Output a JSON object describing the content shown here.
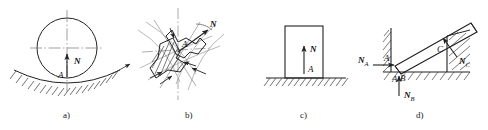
{
  "figure": {
    "stroke_color": "#222222",
    "thin_color": "#555555",
    "background": "#ffffff",
    "panels": [
      {
        "id": "a",
        "caption": "a)",
        "description": "Cylinder resting in a concave hatched surface; normal force N acts vertically upward through contact point A along the line of centers.",
        "labels": [
          {
            "name": "force-label-n",
            "text": "N"
          },
          {
            "name": "point-label-a",
            "text": "A"
          }
        ],
        "force": {
          "symbol": "N",
          "direction": "vertical-up",
          "angle_deg": 90
        },
        "contact_point": "A"
      },
      {
        "id": "b",
        "caption": "b)",
        "description": "Two irregular hatched bodies in point contact at A; normal force N is directed along the common normal, inclined up and to the right.",
        "labels": [
          {
            "name": "force-label-n",
            "text": "N"
          },
          {
            "name": "point-label-a",
            "text": "A"
          }
        ],
        "force": {
          "symbol": "N",
          "direction": "up-right",
          "angle_deg": 35
        },
        "contact_point": "A"
      },
      {
        "id": "c",
        "caption": "c)",
        "description": "Rectangular block resting on a flat hatched ground; normal force N acts vertically upward at contact point A.",
        "labels": [
          {
            "name": "force-label-n",
            "text": "N"
          },
          {
            "name": "point-label-a",
            "text": "A"
          }
        ],
        "force": {
          "symbol": "N",
          "direction": "vertical-up",
          "angle_deg": 90
        },
        "contact_point": "A"
      },
      {
        "id": "d",
        "caption": "d)",
        "description": "Inclined bar seated in a hatched corner and leaning on edge C; three normal reactions N_A horizontal, N_B vertical, N_C perpendicular to the bar.",
        "labels": [
          {
            "name": "force-label-na",
            "text": "N",
            "sub": "A"
          },
          {
            "name": "force-label-nb",
            "text": "N",
            "sub": "B"
          },
          {
            "name": "force-label-nc",
            "text": "N",
            "sub": "C"
          },
          {
            "name": "point-label-a",
            "text": "A"
          },
          {
            "name": "point-label-b",
            "text": "B"
          },
          {
            "name": "point-label-c",
            "text": "C"
          }
        ],
        "forces": [
          {
            "symbol": "N_A",
            "direction": "horizontal-right",
            "angle_deg": 0
          },
          {
            "symbol": "N_B",
            "direction": "vertical-up",
            "angle_deg": 90
          },
          {
            "symbol": "N_C",
            "direction": "up-left-normal-to-bar",
            "angle_deg": 125
          }
        ],
        "contact_points": [
          "A",
          "B",
          "C"
        ]
      }
    ]
  }
}
